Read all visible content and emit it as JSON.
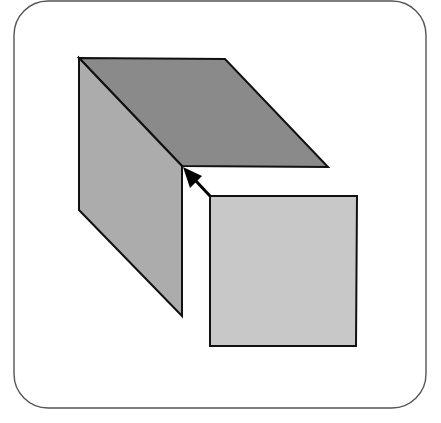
{
  "diagram": {
    "title": "Cube face folding into place",
    "frame": {
      "x": 14,
      "y": 1,
      "width": 412,
      "height": 407,
      "radius": 34,
      "stroke": "#555555",
      "fill": "#ffffff"
    },
    "faces": [
      {
        "id": "top-face",
        "label": "Top face",
        "fill": "#8a8a8a",
        "points": "79,58 225,59 328,167 182,166"
      },
      {
        "id": "left-face",
        "label": "Left face",
        "fill": "#acacac",
        "points": "79,58 182,166 182,316 79,210"
      },
      {
        "id": "front-face",
        "label": "Front face (detached)",
        "fill": "#c8c8c8",
        "points": "210,196 357,196 356,346 210,346"
      }
    ],
    "arrow": {
      "label": "Fold direction",
      "from": [
        210,
        196
      ],
      "to": [
        184,
        168
      ],
      "color": "#000000"
    },
    "colors": {
      "outline": "#111111",
      "background": "#ffffff"
    }
  }
}
